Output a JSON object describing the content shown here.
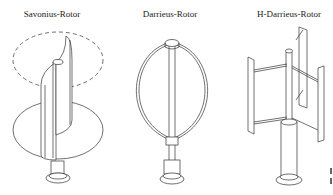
{
  "diagram": {
    "rotors": [
      {
        "id": "savonius",
        "label": "Savonius-Rotor"
      },
      {
        "id": "darrieus",
        "label": "Darrieus-Rotor"
      },
      {
        "id": "h-darrieus",
        "label": "H-Darrieus-Rotor"
      }
    ],
    "colors": {
      "line": "#333333",
      "background": "#ffffff"
    }
  }
}
